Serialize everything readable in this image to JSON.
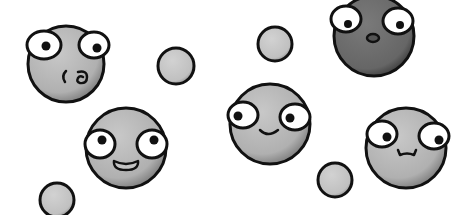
{
  "scene": {
    "title": "Cartoon ball faces",
    "width": 464,
    "height": 215,
    "background": "#ffffff",
    "colors": {
      "outline": "#111111",
      "light_ball": "#b8b8b8",
      "dark_ball": "#6a6a6a",
      "small_ball": "#c6c6c6",
      "eye_white": "#ffffff",
      "pupil": "#111111"
    },
    "small_balls": [
      {
        "cx": 176,
        "cy": 66,
        "r": 18
      },
      {
        "cx": 275,
        "cy": 44,
        "r": 17
      },
      {
        "cx": 335,
        "cy": 180,
        "r": 17
      },
      {
        "cx": 57,
        "cy": 200,
        "r": 17
      }
    ],
    "faces": [
      {
        "id": "kissy",
        "cx": 66,
        "cy": 64,
        "r": 38,
        "tone": "light",
        "expression": "kiss"
      },
      {
        "id": "surprised",
        "cx": 374,
        "cy": 36,
        "r": 40,
        "tone": "dark",
        "expression": "surprised"
      },
      {
        "id": "grin",
        "cx": 126,
        "cy": 148,
        "r": 40,
        "tone": "light",
        "expression": "open-smile"
      },
      {
        "id": "smile",
        "cx": 270,
        "cy": 124,
        "r": 40,
        "tone": "light",
        "expression": "smile"
      },
      {
        "id": "wavy",
        "cx": 406,
        "cy": 148,
        "r": 40,
        "tone": "light",
        "expression": "wavy"
      }
    ]
  }
}
